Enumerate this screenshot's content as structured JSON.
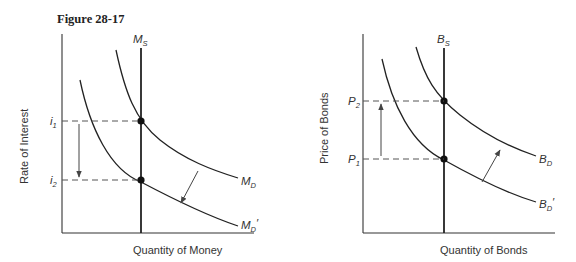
{
  "figure": {
    "title": "Figure 28-17"
  },
  "money_market": {
    "ylabel": "Rate of Interest",
    "xlabel": "Quantity of Money",
    "supply_label": {
      "main": "M",
      "sub": "S"
    },
    "demand_label": {
      "main": "M",
      "sub": "D"
    },
    "demand_new_label": {
      "main": "M",
      "sub": "D",
      "prime": "′"
    },
    "y_ticks": [
      {
        "main": "i",
        "sub": "1"
      },
      {
        "main": "i",
        "sub": "2"
      }
    ],
    "shift": "Money demand decreases from M_D to M_D′; interest rate falls from i1 to i2"
  },
  "bond_market": {
    "ylabel": "Price of Bonds",
    "xlabel": "Quantity of Bonds",
    "supply_label": {
      "main": "B",
      "sub": "S"
    },
    "demand_label": {
      "main": "B",
      "sub": "D"
    },
    "demand_new_label": {
      "main": "B",
      "sub": "D",
      "prime": "′"
    },
    "y_ticks": [
      {
        "main": "P",
        "sub": "2"
      },
      {
        "main": "P",
        "sub": "1"
      }
    ],
    "shift": "Bond demand increases from B_D′ to B_D; bond price rises from P1 to P2"
  },
  "colors": {
    "line": "#222222",
    "dash": "#555555",
    "text": "#333333",
    "background": "#ffffff"
  }
}
